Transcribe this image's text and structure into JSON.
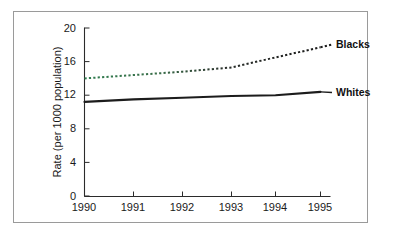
{
  "chart_data": {
    "type": "line",
    "title": "",
    "subtitle": "",
    "xlabel": "",
    "ylabel": "Rate (per 1000 population)",
    "categories": [
      "1990",
      "1991",
      "1992",
      "1993",
      "1994",
      "1995"
    ],
    "x": [
      1990,
      1991,
      1992,
      1993,
      1994,
      1995
    ],
    "xlim": [
      1990,
      1995
    ],
    "ylim": [
      0,
      20
    ],
    "yticks": [
      "0",
      "4",
      "8",
      "12",
      "16",
      "20"
    ],
    "ytick_values": [
      0,
      4,
      8,
      12,
      16,
      20
    ],
    "xticks": [
      "1990",
      "1991",
      "1992",
      "1993",
      "1994",
      "1995"
    ],
    "grid": false,
    "legend_position": "inline-right-of-series",
    "series": [
      {
        "name": "Blacks",
        "style": "dotted",
        "color": "#1c1c1c",
        "values": [
          14.0,
          14.4,
          14.8,
          15.3,
          16.5,
          17.7
        ]
      },
      {
        "name": "Whites",
        "style": "solid",
        "color": "#1c1c1c",
        "values": [
          11.2,
          11.5,
          11.7,
          11.9,
          12.0,
          12.4
        ]
      }
    ]
  },
  "labels": {
    "blacks": "Blacks",
    "whites": "Whites"
  },
  "axis": {
    "y_title": "Rate (per 1000 population)"
  }
}
